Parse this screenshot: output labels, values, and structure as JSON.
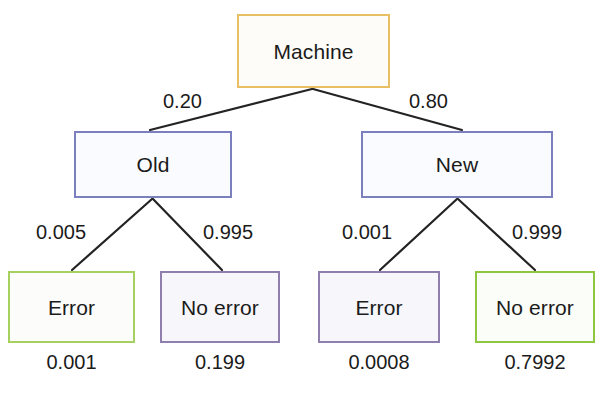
{
  "diagram": {
    "type": "probability-tree",
    "root": {
      "label": "Machine",
      "border_color": "#e8bf63"
    },
    "level1": [
      {
        "label": "Old",
        "probability": "0.20",
        "border_color": "#7b7fbe"
      },
      {
        "label": "New",
        "probability": "0.80",
        "border_color": "#7b7fbe"
      }
    ],
    "leaves": [
      {
        "label": "Error",
        "probability": "0.005",
        "result": "0.001",
        "border_color": "#a6d161"
      },
      {
        "label": "No error",
        "probability": "0.995",
        "result": "0.199",
        "border_color": "#8e7fae"
      },
      {
        "label": "Error",
        "probability": "0.001",
        "result": "0.0008",
        "border_color": "#8e7fae"
      },
      {
        "label": "No error",
        "probability": "0.999",
        "result": "0.7992",
        "border_color": "#8ec63f"
      }
    ],
    "edge_color": "#232323"
  }
}
